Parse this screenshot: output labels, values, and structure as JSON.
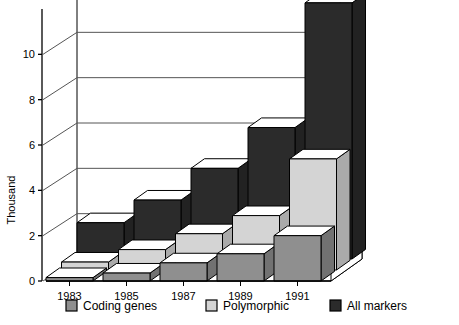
{
  "chart_data": {
    "type": "bar",
    "title": "",
    "subtitle": "",
    "xlabel": "",
    "ylabel": "Thousand",
    "projection": "3d",
    "grid": true,
    "legend_position": "bottom",
    "ylim": [
      0,
      12
    ],
    "yticks": [
      0,
      2,
      4,
      6,
      8,
      10
    ],
    "ytick_labels": [
      "0",
      "2",
      "4",
      "6",
      "8",
      "10"
    ],
    "categories": [
      "1983",
      "1985",
      "1987",
      "1989",
      "1991"
    ],
    "x": [
      "1983",
      "1985",
      "1987",
      "1989",
      "1991"
    ],
    "series": [
      {
        "name": "All markers",
        "color": "#2b2b2b",
        "values": [
          1.6,
          2.6,
          4.0,
          5.8,
          11.3
        ]
      },
      {
        "name": "Polymorphic",
        "color": "#d4d4d4",
        "values": [
          0.35,
          0.9,
          1.6,
          2.4,
          4.9
        ]
      },
      {
        "name": "Coding genes",
        "color": "#8f8f8f",
        "values": [
          0.15,
          0.35,
          0.8,
          1.2,
          2.0
        ]
      }
    ],
    "annotations": []
  },
  "axes": {
    "y_title": "Thousand",
    "y_tick_labels": [
      "0",
      "2",
      "4",
      "6",
      "8",
      "10"
    ],
    "x_tick_labels": [
      "1983",
      "1985",
      "1987",
      "1989",
      "1991"
    ]
  },
  "legend": {
    "items": [
      {
        "label": "Coding genes",
        "color": "#8f8f8f"
      },
      {
        "label": "Polymorphic",
        "color": "#d4d4d4"
      },
      {
        "label": "All markers",
        "color": "#2b2b2b"
      }
    ]
  },
  "colors": {
    "axis": "#000000",
    "grid": "#555555",
    "wall": "#ffffff",
    "floor": "#ffffff",
    "coding_genes": "#8f8f8f",
    "polymorphic": "#d4d4d4",
    "all_markers": "#2b2b2b",
    "bar_top_light": "#ffffff",
    "outline": "#000000"
  }
}
